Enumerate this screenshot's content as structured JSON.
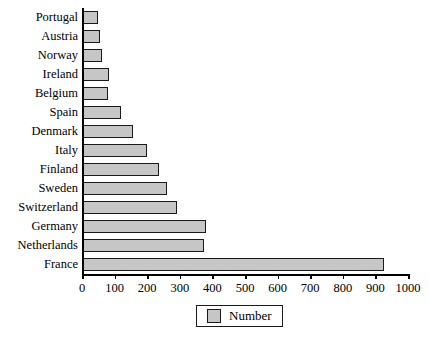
{
  "chart_data": {
    "type": "bar",
    "orientation": "horizontal",
    "title": "",
    "xlabel": "",
    "ylabel": "",
    "xlim": [
      0,
      1000
    ],
    "grid": false,
    "legend_position": "bottom",
    "categories": [
      "Portugal",
      "Austria",
      "Norway",
      "Ireland",
      "Belgium",
      "Spain",
      "Denmark",
      "Italy",
      "Finland",
      "Sweden",
      "Switzerland",
      "Germany",
      "Netherlands",
      "France"
    ],
    "values": [
      48,
      55,
      60,
      82,
      80,
      120,
      155,
      200,
      235,
      260,
      290,
      380,
      375,
      925
    ],
    "series": [
      {
        "name": "Number",
        "values": [
          48,
          55,
          60,
          82,
          80,
          120,
          155,
          200,
          235,
          260,
          290,
          380,
          375,
          925
        ],
        "color": "#c6c6c6",
        "edge_color": "#1a1a1a"
      }
    ],
    "xticks": [
      0,
      100,
      200,
      300,
      400,
      500,
      600,
      700,
      800,
      900,
      1000
    ],
    "xtick_labels": [
      "0",
      "100",
      "200",
      "300",
      "400",
      "500",
      "600",
      "700",
      "800",
      "900",
      "1000"
    ]
  },
  "legend": {
    "label": "Number"
  }
}
